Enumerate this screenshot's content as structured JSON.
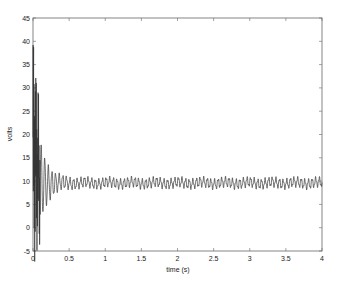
{
  "chart_data": {
    "type": "line",
    "title": "",
    "xlabel": "time (s)",
    "ylabel": "volts",
    "xlim": [
      0,
      4
    ],
    "ylim": [
      -5,
      45
    ],
    "grid": false,
    "legend": null,
    "xticks": [
      0,
      0.5,
      1,
      1.5,
      2,
      2.5,
      3,
      3.5,
      4
    ],
    "xtick_labels": [
      "0",
      "0.5",
      "1",
      "1.5",
      "2",
      "2.5",
      "3",
      "3.5",
      "4"
    ],
    "yticks": [
      -5,
      0,
      5,
      10,
      15,
      20,
      25,
      30,
      35,
      40,
      45
    ],
    "ytick_labels": [
      "-5",
      "0",
      "5",
      "10",
      "15",
      "20",
      "25",
      "30",
      "35",
      "40",
      "45"
    ],
    "series": [
      {
        "name": "voltage",
        "color": "#333333",
        "description": "Damped oscillation: large transient up to ~44 V near t=0, dipping to ~0 V around t=0.1 s, settling to ~9.5 V with ~±1 V ripple by t≈0.5 s",
        "x": [
          0.0,
          0.01,
          0.02,
          0.03,
          0.04,
          0.05,
          0.06,
          0.07,
          0.08,
          0.09,
          0.1,
          0.12,
          0.14,
          0.16,
          0.18,
          0.2,
          0.22,
          0.24,
          0.26,
          0.28,
          0.3,
          0.35,
          0.4,
          0.45,
          0.5,
          0.6,
          0.7,
          0.8,
          1.0,
          1.5,
          2.0,
          2.5,
          3.0,
          3.5,
          4.0
        ],
        "y": [
          8,
          44,
          4,
          38,
          10,
          30,
          2,
          20,
          6,
          16,
          0,
          17,
          7,
          15,
          8,
          13,
          9,
          12,
          8.5,
          11.5,
          9,
          11,
          8.5,
          10.8,
          9,
          10.5,
          9.5,
          10,
          9.5,
          9.3,
          9.0,
          9.2,
          9.0,
          9.1,
          9.3
        ]
      }
    ]
  }
}
